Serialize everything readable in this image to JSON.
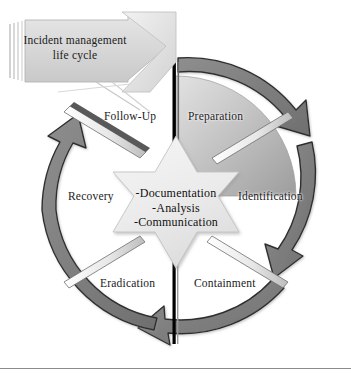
{
  "figure": {
    "title": "Incident management life cycle",
    "shape": "circular-cycle-diagram"
  },
  "banner": {
    "name": "incident-management-banner",
    "line1": "Incident management",
    "line2": "life cycle",
    "fill": "#d9d9d9",
    "stacked_edges": 4
  },
  "cycle": {
    "direction": "clockwise",
    "highlighted_phase": "Preparation",
    "phases": [
      {
        "id": "preparation",
        "label": "Preparation",
        "quadrant": "top-right",
        "shaded": true
      },
      {
        "id": "identification",
        "label": "Identification",
        "quadrant": "right",
        "shaded": false
      },
      {
        "id": "containment",
        "label": "Containment",
        "quadrant": "bottom-right",
        "shaded": false
      },
      {
        "id": "eradication",
        "label": "Eradication",
        "quadrant": "bottom-left",
        "shaded": false
      },
      {
        "id": "recovery",
        "label": "Recovery",
        "quadrant": "left",
        "shaded": false
      },
      {
        "id": "follow_up",
        "label": "Follow-Up",
        "quadrant": "top-left",
        "shaded": false
      }
    ]
  },
  "core": {
    "name": "central-star",
    "shape": "six-pointed-star",
    "items": [
      "-Documentation",
      "-Analysis",
      "-Communication"
    ],
    "fill": "#ededed"
  },
  "ring": {
    "name": "outer-arrow-ring",
    "segments": 4,
    "arrow_fill": "#7e7e7e",
    "arrow_stroke": "#2b2b2b"
  },
  "colors": {
    "background": "#ffffff",
    "text": "#1a1a1a",
    "divider": "#000000",
    "wedge_light": "#dcdcdc",
    "wedge_dark": "#a3a3a3",
    "rule": "#8a8a8a"
  }
}
